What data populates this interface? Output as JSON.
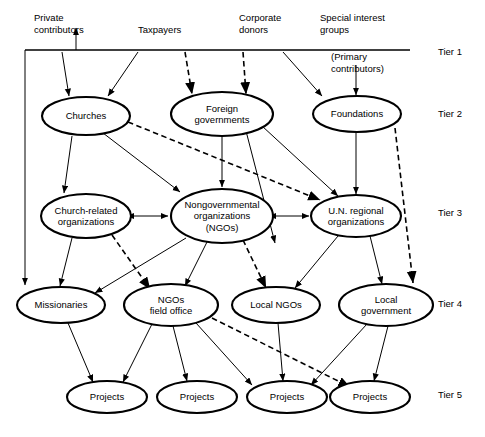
{
  "figure": {
    "type": "flow-diagram"
  },
  "tier_labels": [
    {
      "id": "tier1",
      "label": "Tier 1",
      "x": 438,
      "y": 55
    },
    {
      "id": "tier2",
      "label": "Tier 2",
      "x": 438,
      "y": 117
    },
    {
      "id": "tier3",
      "label": "Tier 3",
      "x": 438,
      "y": 216
    },
    {
      "id": "tier4",
      "label": "Tier 4",
      "x": 438,
      "y": 307
    },
    {
      "id": "tier5",
      "label": "Tier 5",
      "x": 438,
      "y": 398
    }
  ],
  "tier1": {
    "contributors": [
      {
        "id": "private-contributors",
        "lines": [
          "Private",
          "contributors"
        ],
        "x": 34,
        "y": 21,
        "anchor": "start"
      },
      {
        "id": "taxpayers",
        "lines": [
          "Taxpayers"
        ],
        "x": 138,
        "y": 33,
        "anchor": "start"
      },
      {
        "id": "corporate-donors",
        "lines": [
          "Corporate",
          "donors"
        ],
        "x": 239,
        "y": 21,
        "anchor": "start"
      },
      {
        "id": "special-interest-groups",
        "lines": [
          "Special interest",
          "groups"
        ],
        "x": 320,
        "y": 21,
        "anchor": "start"
      }
    ],
    "note": {
      "id": "primary-contributors-note",
      "lines": [
        "(Primary",
        "contributors)"
      ],
      "x": 331,
      "y": 60,
      "anchor": "start"
    },
    "rule": {
      "x1": 25,
      "y1": 50,
      "x2": 410,
      "y2": 50
    }
  },
  "nodes": [
    {
      "id": "churches",
      "label": [
        "Churches"
      ],
      "cx": 86,
      "cy": 116,
      "rx": 44,
      "ry": 19
    },
    {
      "id": "foreign-governments",
      "label": [
        "Foreign",
        "governments"
      ],
      "cx": 222,
      "cy": 114,
      "rx": 51,
      "ry": 22
    },
    {
      "id": "foundations",
      "label": [
        "Foundations"
      ],
      "cx": 357,
      "cy": 114,
      "rx": 44,
      "ry": 18
    },
    {
      "id": "church-related-organizations",
      "label": [
        "Church-related",
        "organizations"
      ],
      "cx": 86,
      "cy": 216,
      "rx": 45,
      "ry": 22
    },
    {
      "id": "nongovernmental-organizations",
      "label": [
        "Nongovernmental",
        "organizations",
        "(NGOs)"
      ],
      "cx": 222,
      "cy": 216,
      "rx": 51,
      "ry": 27
    },
    {
      "id": "un-regional-organizations",
      "label": [
        "U.N. regional",
        "organizations"
      ],
      "cx": 356,
      "cy": 216,
      "rx": 45,
      "ry": 21
    },
    {
      "id": "missionaries",
      "label": [
        "Missionaries"
      ],
      "cx": 61,
      "cy": 305,
      "rx": 44,
      "ry": 18
    },
    {
      "id": "ngos-field-office",
      "label": [
        "NGOs",
        "field office"
      ],
      "cx": 171,
      "cy": 305,
      "rx": 47,
      "ry": 21
    },
    {
      "id": "local-ngos",
      "label": [
        "Local NGOs"
      ],
      "cx": 276,
      "cy": 305,
      "rx": 44,
      "ry": 18
    },
    {
      "id": "local-government",
      "label": [
        "Local",
        "government"
      ],
      "cx": 386,
      "cy": 305,
      "rx": 47,
      "ry": 21
    },
    {
      "id": "projects-1",
      "label": [
        "Projects"
      ],
      "cx": 107,
      "cy": 397,
      "rx": 40,
      "ry": 16
    },
    {
      "id": "projects-2",
      "label": [
        "Projects"
      ],
      "cx": 197,
      "cy": 397,
      "rx": 40,
      "ry": 16
    },
    {
      "id": "projects-3",
      "label": [
        "Projects"
      ],
      "cx": 287,
      "cy": 397,
      "rx": 40,
      "ry": 16
    },
    {
      "id": "projects-4",
      "label": [
        "Projects"
      ],
      "cx": 370,
      "cy": 397,
      "rx": 40,
      "ry": 16
    }
  ],
  "edges": [
    {
      "id": "private-to-bracket",
      "style": "solid",
      "arrow": "end",
      "points": [
        [
          76,
          50
        ],
        [
          76,
          28
        ]
      ]
    },
    {
      "id": "bracket-left-down",
      "style": "solid",
      "arrow": "end",
      "points": [
        [
          25,
          50
        ],
        [
          25,
          285
        ]
      ]
    },
    {
      "id": "private-to-churches",
      "style": "solid",
      "arrow": "end",
      "points": [
        [
          62,
          52
        ],
        [
          69,
          96
        ]
      ]
    },
    {
      "id": "taxpayers-to-churches",
      "style": "solid",
      "arrow": "end",
      "points": [
        [
          138,
          52
        ],
        [
          108,
          96
        ]
      ]
    },
    {
      "id": "taxpayers-to-foreign",
      "style": "dashed",
      "arrow": "end",
      "points": [
        [
          185,
          52
        ],
        [
          192,
          94
        ]
      ]
    },
    {
      "id": "corporate-to-foreign",
      "style": "dashed",
      "arrow": "end",
      "points": [
        [
          243,
          52
        ],
        [
          246,
          94
        ]
      ]
    },
    {
      "id": "corporate-to-foundations",
      "style": "solid",
      "arrow": "end",
      "points": [
        [
          283,
          52
        ],
        [
          322,
          96
        ]
      ]
    },
    {
      "id": "special-to-foundations",
      "style": "solid",
      "arrow": "end",
      "points": [
        [
          356,
          65
        ],
        [
          356,
          95
        ]
      ]
    },
    {
      "id": "churches-to-church-related",
      "style": "solid",
      "arrow": "end",
      "points": [
        [
          72,
          136
        ],
        [
          64,
          193
        ]
      ]
    },
    {
      "id": "churches-to-ngos",
      "style": "solid",
      "arrow": "end",
      "points": [
        [
          103,
          133
        ],
        [
          180,
          192
        ]
      ]
    },
    {
      "id": "churches-to-un",
      "style": "dashed",
      "arrow": "end",
      "points": [
        [
          128,
          122
        ],
        [
          320,
          200
        ]
      ]
    },
    {
      "id": "foreign-to-ngos",
      "style": "solid",
      "arrow": "end",
      "points": [
        [
          222,
          136
        ],
        [
          222,
          187
        ]
      ]
    },
    {
      "id": "foreign-to-ngos-right",
      "style": "solid",
      "arrow": "end",
      "points": [
        [
          246,
          131
        ],
        [
          275,
          243
        ]
      ]
    },
    {
      "id": "foreign-to-un",
      "style": "solid",
      "arrow": "end",
      "points": [
        [
          262,
          126
        ],
        [
          338,
          196
        ]
      ]
    },
    {
      "id": "foundations-to-un",
      "style": "solid",
      "arrow": "end",
      "points": [
        [
          356,
          132
        ],
        [
          356,
          194
        ]
      ]
    },
    {
      "id": "foundations-to-local-government",
      "style": "dashed",
      "arrow": "end",
      "points": [
        [
          395,
          128
        ],
        [
          413,
          283
        ]
      ]
    },
    {
      "id": "church-related-ngos-link",
      "style": "solid",
      "arrow": "both",
      "points": [
        [
          134,
          216
        ],
        [
          168,
          216
        ]
      ]
    },
    {
      "id": "ngos-un-link",
      "style": "solid",
      "arrow": "both",
      "points": [
        [
          276,
          216
        ],
        [
          309,
          216
        ]
      ]
    },
    {
      "id": "church-related-to-missionaries",
      "style": "solid",
      "arrow": "end",
      "points": [
        [
          72,
          238
        ],
        [
          60,
          286
        ]
      ]
    },
    {
      "id": "church-related-to-ngos-field",
      "style": "dashed",
      "arrow": "end",
      "points": [
        [
          112,
          235
        ],
        [
          150,
          289
        ]
      ]
    },
    {
      "id": "ngos-to-missionaries",
      "style": "solid",
      "arrow": "end",
      "points": [
        [
          186,
          238
        ],
        [
          95,
          293
        ]
      ]
    },
    {
      "id": "ngos-to-ngos-field",
      "style": "solid",
      "arrow": "end",
      "points": [
        [
          207,
          242
        ],
        [
          185,
          286
        ]
      ]
    },
    {
      "id": "ngos-to-local-ngos",
      "style": "dashed",
      "arrow": "end",
      "points": [
        [
          243,
          240
        ],
        [
          266,
          288
        ]
      ]
    },
    {
      "id": "un-to-local-ngos",
      "style": "solid",
      "arrow": "end",
      "points": [
        [
          338,
          236
        ],
        [
          295,
          288
        ]
      ]
    },
    {
      "id": "un-to-local-government",
      "style": "solid",
      "arrow": "end",
      "points": [
        [
          370,
          236
        ],
        [
          382,
          284
        ]
      ]
    },
    {
      "id": "missionaries-to-projects1",
      "style": "solid",
      "arrow": "end",
      "points": [
        [
          68,
          323
        ],
        [
          93,
          382
        ]
      ]
    },
    {
      "id": "ngos-field-to-projects1",
      "style": "solid",
      "arrow": "end",
      "points": [
        [
          152,
          324
        ],
        [
          123,
          382
        ]
      ]
    },
    {
      "id": "ngos-field-to-projects2",
      "style": "solid",
      "arrow": "end",
      "points": [
        [
          173,
          326
        ],
        [
          187,
          381
        ]
      ]
    },
    {
      "id": "ngos-field-to-projects3",
      "style": "solid",
      "arrow": "end",
      "points": [
        [
          196,
          323
        ],
        [
          252,
          385
        ]
      ]
    },
    {
      "id": "ngos-field-to-projects4",
      "style": "dashed",
      "arrow": "end",
      "points": [
        [
          212,
          318
        ],
        [
          350,
          387
        ]
      ]
    },
    {
      "id": "local-ngos-to-projects3",
      "style": "solid",
      "arrow": "end",
      "points": [
        [
          278,
          323
        ],
        [
          283,
          381
        ]
      ]
    },
    {
      "id": "local-government-to-projects3",
      "style": "solid",
      "arrow": "end",
      "points": [
        [
          367,
          324
        ],
        [
          311,
          385
        ]
      ]
    },
    {
      "id": "local-government-to-projects4",
      "style": "solid",
      "arrow": "end",
      "points": [
        [
          388,
          326
        ],
        [
          374,
          381
        ]
      ]
    }
  ]
}
